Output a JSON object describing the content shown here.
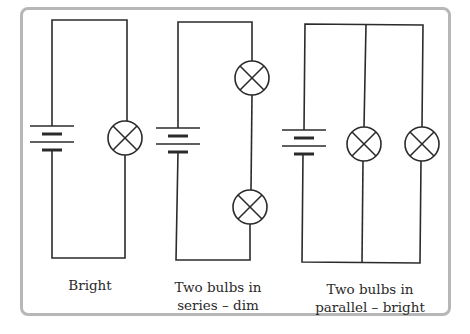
{
  "figure": {
    "colors": {
      "frame": "#b7b7b7",
      "wire": "#2b2b2b",
      "text": "#2a2a2a",
      "background": "#ffffff"
    }
  },
  "circuits": [
    {
      "id": "single",
      "caption_line1": "Bright",
      "caption_line2": "",
      "bulbs": 1,
      "arrangement": "single",
      "brightness": "bright",
      "symbols": [
        "cell-battery-icon",
        "bulb-icon"
      ]
    },
    {
      "id": "series",
      "caption_line1": "Two bulbs in",
      "caption_line2": "series – dim",
      "bulbs": 2,
      "arrangement": "series",
      "brightness": "dim",
      "symbols": [
        "cell-battery-icon",
        "bulb-icon",
        "bulb-icon"
      ]
    },
    {
      "id": "parallel",
      "caption_line1": "Two bulbs in",
      "caption_line2": "parallel – bright",
      "bulbs": 2,
      "arrangement": "parallel",
      "brightness": "bright",
      "symbols": [
        "cell-battery-icon",
        "bulb-icon",
        "bulb-icon"
      ]
    }
  ]
}
